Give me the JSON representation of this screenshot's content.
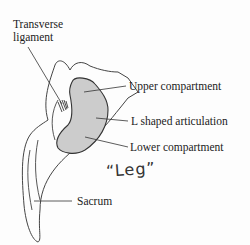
{
  "diagram": {
    "labels": {
      "transverse_ligament_line1": "Transverse",
      "transverse_ligament_line2": "ligament",
      "upper_compartment": "Upper compartment",
      "l_shaped_articulation": "L shaped articulation",
      "lower_compartment": "Lower compartment",
      "sacrum": "Sacrum"
    },
    "handwritten_note": "“Leg”",
    "colors": {
      "articulation_fill": "#cccccc",
      "outline": "#333333"
    }
  }
}
